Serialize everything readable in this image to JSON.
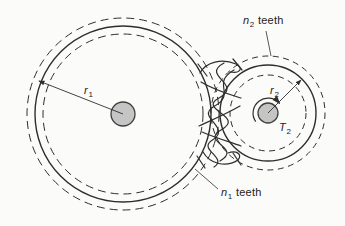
{
  "labels": {
    "n2": {
      "base": "n",
      "sub": "2",
      "rest": "teeth"
    },
    "n1": {
      "base": "n",
      "sub": "1",
      "rest": "teeth"
    },
    "r1": {
      "base": "r",
      "sub": "1"
    },
    "r2": {
      "base": "r",
      "sub": "2"
    },
    "t2": {
      "base": "T",
      "sub": "2"
    }
  },
  "diagram": {
    "canvas": {
      "width": 345,
      "height": 226,
      "background": "#fbfbf9"
    },
    "colors": {
      "line": "#2e2e2e",
      "hub_fill": "#c5c5c5",
      "hub_stroke": "#3f3f3f"
    },
    "gear1": {
      "cx": 123,
      "cy": 114,
      "addendum_r": 96,
      "pitch_r": 88,
      "root_r": 80,
      "hub_r": 12,
      "dash": "8 5",
      "radius_line": {
        "x1": 123,
        "y1": 114,
        "x2": 39,
        "y2": 81
      },
      "label_pos": {
        "x": 84,
        "y": 84
      }
    },
    "gear2": {
      "cx": 268,
      "cy": 113,
      "addendum_r": 57,
      "pitch_r": 48,
      "root_r": 38,
      "hub_r": 10,
      "dash": "6 4.5",
      "radius_line": {
        "x1": 268,
        "y1": 113,
        "x2": 301,
        "y2": 80
      },
      "label_pos": {
        "x": 270,
        "y": 84
      },
      "torque_arc": "M 255.7 121.6 A 15 15 0 0 1 279.5 103.4",
      "torque_label_pos": {
        "x": 279,
        "y": 121
      }
    },
    "annotations": {
      "n2": {
        "label_pos": {
          "x": 243,
          "y": 14
        },
        "leader": {
          "x1": 266,
          "y1": 31,
          "x2": 271,
          "y2": 56
        }
      },
      "n1": {
        "label_pos": {
          "x": 221,
          "y": 186
        },
        "leader": {
          "x1": 218,
          "y1": 189,
          "x2": 195,
          "y2": 169
        }
      }
    },
    "mesh_paths": [
      "M 200 73 C 206 62 222 58 236 64 C 244 68 240 74 230 72",
      "M 224 63 C 200 76 244 84 219 98 C 197 110 246 116 221 130 C 200 142 243 148 220 161",
      "M 234 70 C 210 84 238 94 213 107 C 196 118 234 128 211 141 C 199 150 228 158 214 167",
      "M 201 82 C 214 90 228 94 241 98 M 240 106 C 226 114 212 120 199 126 M 202 132 C 216 138 230 142 241 146",
      "M 203 152 C 210 164 226 168 238 160 C 243 154 236 150 228 153",
      "M 198 64 L 207 76 M 233 59 L 242 70 M 197 156 L 205 168 M 233 153 L 241 165"
    ]
  }
}
